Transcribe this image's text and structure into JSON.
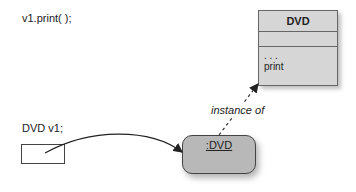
{
  "code_line": "v1.print( );",
  "variable_declaration": "DVD v1;",
  "class_box": {
    "name": "DVD",
    "fields_placeholder": "",
    "methods": [
      ". . .",
      "print"
    ]
  },
  "object": {
    "label": ":DVD"
  },
  "relation_label": "instance of"
}
